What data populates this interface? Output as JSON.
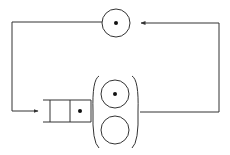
{
  "diagram": {
    "type": "queueing-network",
    "colors": {
      "stroke": "#333333",
      "background": "#ffffff",
      "dot": "#111111"
    },
    "nodes": [
      {
        "id": "top-station",
        "kind": "server",
        "jobs": 1
      },
      {
        "id": "queue",
        "kind": "fifo-queue",
        "slots": 2,
        "jobs": 1
      },
      {
        "id": "server-1",
        "kind": "server",
        "jobs": 1
      },
      {
        "id": "server-2",
        "kind": "server",
        "jobs": 0
      }
    ],
    "edges": [
      {
        "from": "top-station",
        "to": "queue",
        "route": "left then down"
      },
      {
        "from": "multi-server-station",
        "to": "top-station",
        "route": "right then up"
      }
    ]
  }
}
